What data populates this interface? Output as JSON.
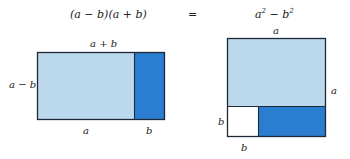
{
  "equation": {
    "left": "(a − b)(a + b)",
    "equals": "=",
    "right_a": "a",
    "right_exp1": "2",
    "right_minus": " − b",
    "right_exp2": "2"
  },
  "left_figure": {
    "top_label": "a + b",
    "side_label": "a − b",
    "bottom_label_a": "a",
    "bottom_label_b": "b",
    "colors": {
      "light": "#bcd8ec",
      "dark": "#2a7dd1",
      "stroke": "#1e2a38"
    }
  },
  "right_figure": {
    "top_label": "a",
    "right_label": "a",
    "left_label": "b",
    "bottom_label": "b",
    "colors": {
      "light": "#bcd8ec",
      "dark": "#2a7dd1",
      "white": "#ffffff",
      "stroke": "#1e2a38"
    }
  }
}
